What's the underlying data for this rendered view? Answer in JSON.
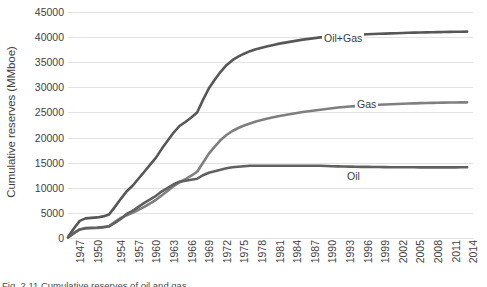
{
  "chart_data": {
    "type": "line",
    "title": "",
    "xlabel": "",
    "ylabel": "Cumulative reserves (MMboe)",
    "ylim": [
      0,
      45000
    ],
    "xlim": [
      1947,
      2016
    ],
    "grid": true,
    "legend_position": "inline-labels",
    "y_ticks": [
      45000,
      40000,
      35000,
      30000,
      25000,
      20000,
      15000,
      10000,
      5000,
      0
    ],
    "y_tick_labels": [
      "45000",
      "40000",
      "35000",
      "30000",
      "25000",
      "20000",
      "15000",
      "10000",
      "5000",
      "0"
    ],
    "x_tick_labels": [
      "1947",
      "1950",
      "1954",
      "1957",
      "1960",
      "1963",
      "1966",
      "1969",
      "1972",
      "1975",
      "1978",
      "1981",
      "1984",
      "1987",
      "1990",
      "1993",
      "1996",
      "1999",
      "2002",
      "2005",
      "2008",
      "2011",
      "2014"
    ],
    "x": [
      1947,
      1948,
      1949,
      1950,
      1951,
      1952,
      1953,
      1954,
      1955,
      1956,
      1957,
      1958,
      1959,
      1960,
      1961,
      1962,
      1963,
      1964,
      1965,
      1966,
      1967,
      1968,
      1969,
      1970,
      1971,
      1972,
      1973,
      1974,
      1975,
      1976,
      1977,
      1978,
      1979,
      1980,
      1981,
      1982,
      1983,
      1984,
      1985,
      1986,
      1987,
      1988,
      1989,
      1990,
      1991,
      1992,
      1993,
      1994,
      1995,
      1996,
      1997,
      1998,
      1999,
      2000,
      2001,
      2002,
      2003,
      2004,
      2005,
      2006,
      2007,
      2008,
      2009,
      2010,
      2011,
      2012,
      2013,
      2014,
      2015
    ],
    "series": [
      {
        "name": "Oil+Gas",
        "color": "#575757",
        "values": [
          200,
          1900,
          3400,
          3900,
          4000,
          4100,
          4300,
          4700,
          6200,
          7800,
          9300,
          10400,
          11800,
          13200,
          14600,
          16000,
          17800,
          19400,
          21000,
          22300,
          23100,
          24000,
          25000,
          27500,
          29800,
          31500,
          33100,
          34400,
          35400,
          36100,
          36700,
          37200,
          37600,
          37900,
          38200,
          38450,
          38700,
          38900,
          39100,
          39300,
          39500,
          39650,
          39800,
          39950,
          40050,
          40150,
          40250,
          40320,
          40380,
          40440,
          40500,
          40560,
          40610,
          40660,
          40700,
          40740,
          40780,
          40820,
          40860,
          40890,
          40920,
          40950,
          40980,
          41000,
          41020,
          41040,
          41060,
          41080,
          41100
        ]
      },
      {
        "name": "Gas",
        "color": "#7f7f7f",
        "values": [
          100,
          900,
          1700,
          1900,
          1950,
          2000,
          2100,
          2400,
          3200,
          4000,
          4500,
          5000,
          5600,
          6200,
          6900,
          7600,
          8500,
          9400,
          10300,
          11100,
          11700,
          12400,
          13200,
          15000,
          16800,
          18200,
          19500,
          20500,
          21300,
          21900,
          22400,
          22800,
          23200,
          23500,
          23800,
          24050,
          24300,
          24500,
          24700,
          24900,
          25100,
          25250,
          25400,
          25550,
          25700,
          25850,
          25980,
          26080,
          26170,
          26250,
          26330,
          26400,
          26470,
          26530,
          26590,
          26640,
          26690,
          26730,
          26770,
          26810,
          26850,
          26880,
          26910,
          26930,
          26950,
          26970,
          26990,
          27000,
          27010
        ]
      },
      {
        "name": "Oil",
        "color": "#606060",
        "values": [
          100,
          1000,
          1700,
          2000,
          2050,
          2100,
          2200,
          2300,
          3000,
          3800,
          4800,
          5400,
          6200,
          7000,
          7700,
          8400,
          9300,
          10000,
          10700,
          11200,
          11400,
          11600,
          11800,
          12500,
          13000,
          13300,
          13600,
          13900,
          14100,
          14200,
          14300,
          14400,
          14400,
          14400,
          14400,
          14400,
          14400,
          14400,
          14400,
          14400,
          14400,
          14400,
          14400,
          14400,
          14350,
          14300,
          14270,
          14240,
          14210,
          14190,
          14170,
          14160,
          14140,
          14130,
          14110,
          14100,
          14090,
          14090,
          14090,
          14080,
          14070,
          14070,
          14070,
          14070,
          14070,
          14070,
          14070,
          14080,
          14090
        ]
      }
    ],
    "inline_labels": [
      {
        "text": "Oil+Gas",
        "x_px": 322,
        "y_px": 32
      },
      {
        "text": "Gas",
        "x_px": 355,
        "y_px": 98
      },
      {
        "text": "Oil",
        "x_px": 345,
        "y_px": 170
      }
    ],
    "annotations": []
  },
  "figure": {
    "caption": "Fig. 2.11  Cumulative reserves of oil and gas"
  }
}
